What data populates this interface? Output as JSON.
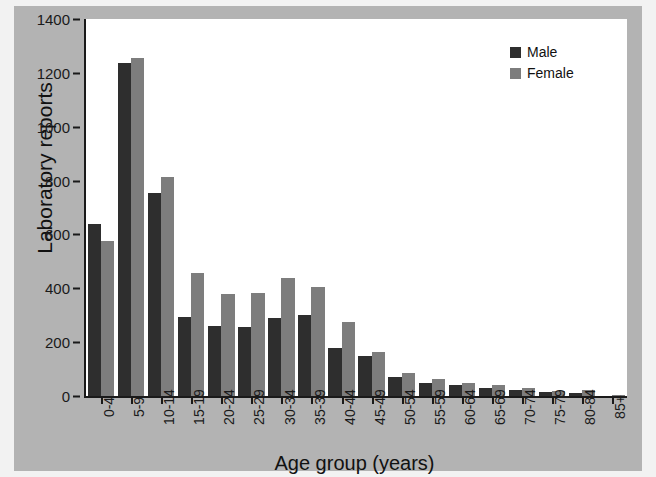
{
  "chart_data": {
    "type": "bar",
    "title": "",
    "xlabel": "Age group (years)",
    "ylabel": "Laboratory reports",
    "ylim": [
      0,
      1400
    ],
    "yticks": [
      0,
      200,
      400,
      600,
      800,
      1000,
      1200,
      1400
    ],
    "ytick_labels": [
      "0",
      "200",
      "400",
      "600",
      "800",
      "1000",
      "1200",
      "1400"
    ],
    "grid": false,
    "legend_position": "top-right",
    "categories": [
      "0-4",
      "5-9",
      "10-14",
      "15-19",
      "20-24",
      "25-29",
      "30-34",
      "35-39",
      "40-44",
      "45-49",
      "50-54",
      "55-59",
      "60-64",
      "65-69",
      "70-74",
      "75-79",
      "80-84",
      "85+"
    ],
    "series": [
      {
        "name": "Male",
        "color": "#2e2e2e",
        "values": [
          640,
          1235,
          755,
          295,
          260,
          258,
          290,
          300,
          180,
          150,
          70,
          48,
          40,
          30,
          22,
          15,
          10,
          0
        ]
      },
      {
        "name": "Female",
        "color": "#7d7d7d",
        "values": [
          575,
          1255,
          815,
          455,
          380,
          383,
          440,
          405,
          275,
          165,
          85,
          62,
          50,
          40,
          28,
          20,
          22,
          4
        ]
      }
    ]
  },
  "legend": {
    "items": [
      {
        "label": "Male"
      },
      {
        "label": "Female"
      }
    ]
  },
  "colors": {
    "male": "#2e2e2e",
    "female": "#7d7d7d",
    "panel_background": "#b3b3b3",
    "plot_background": "#ffffff",
    "axis": "#1a1a1a"
  }
}
